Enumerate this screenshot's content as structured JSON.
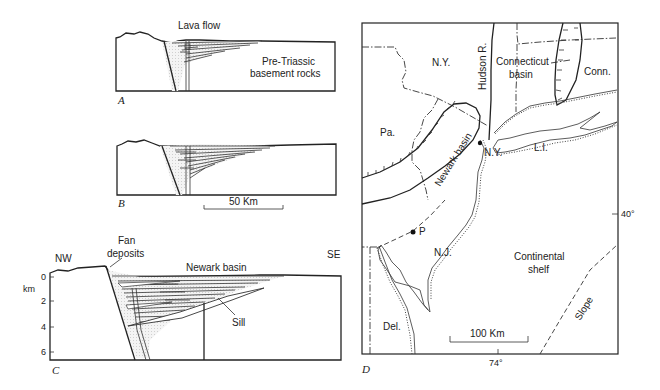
{
  "figure": {
    "panels": {
      "A": {
        "letter": "A",
        "labels": {
          "lava": "Lava flow",
          "basement_1": "Pre-Triassic",
          "basement_2": "basement rocks"
        }
      },
      "B": {
        "letter": "B",
        "scale_bar": "50 Km"
      },
      "C": {
        "letter": "C",
        "labels": {
          "nw": "NW",
          "se": "SE",
          "fan_1": "Fan",
          "fan_2": "deposits",
          "basin": "Newark basin",
          "sill": "Sill",
          "depth_unit": "km"
        },
        "depth_ticks": [
          "0",
          "2",
          "4",
          "6"
        ]
      },
      "D": {
        "letter": "D",
        "labels": {
          "ny_state": "N.Y.",
          "pa": "Pa.",
          "nj": "N.J.",
          "del": "Del.",
          "conn": "Conn.",
          "li": "L.I.",
          "ny_city": "N.Y.",
          "hudson": "Hudson R.",
          "ct_basin_1": "Connecticut",
          "ct_basin_2": "basin",
          "newark": "Newark basin",
          "p_point": "P",
          "shelf_1": "Continental",
          "shelf_2": "shelf",
          "slope": "Slope"
        },
        "scale_bar": "100 Km",
        "lat_label": "40°",
        "lon_label": "74°"
      }
    }
  }
}
